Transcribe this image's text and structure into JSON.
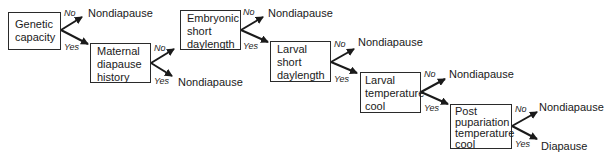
{
  "diagram": {
    "type": "decision-flow",
    "nodes": [
      {
        "id": "genetic",
        "lines": [
          "Genetic",
          "capacity"
        ]
      },
      {
        "id": "maternal",
        "lines": [
          "Maternal",
          "diapause",
          "history"
        ]
      },
      {
        "id": "embryonic",
        "lines": [
          "Embryonic",
          "short",
          "daylength"
        ]
      },
      {
        "id": "larval_day",
        "lines": [
          "Larval",
          "short",
          "daylength"
        ]
      },
      {
        "id": "larval_temp",
        "lines": [
          "Larval",
          "temperature",
          "cool"
        ]
      },
      {
        "id": "postpup",
        "lines": [
          "Post",
          "pupariation",
          "temperature",
          "cool"
        ]
      }
    ],
    "outcomes": {
      "genetic_no": "Nondiapause",
      "maternal_yes": "Nondiapause",
      "embryonic_no": "Nondiapause",
      "larval_day_no": "Nondiapause",
      "larval_temp_no": "Nondiapause",
      "postpup_no": "Nondiapause",
      "postpup_yes": "Diapause"
    },
    "branch_labels": {
      "no": "No",
      "yes": "Yes"
    },
    "edges": [
      {
        "from": "genetic",
        "label": "No",
        "to": "Nondiapause"
      },
      {
        "from": "genetic",
        "label": "Yes",
        "to": "maternal"
      },
      {
        "from": "maternal",
        "label": "No",
        "to": "embryonic"
      },
      {
        "from": "maternal",
        "label": "Yes",
        "to": "Nondiapause"
      },
      {
        "from": "embryonic",
        "label": "No",
        "to": "Nondiapause"
      },
      {
        "from": "embryonic",
        "label": "Yes",
        "to": "larval_day"
      },
      {
        "from": "larval_day",
        "label": "No",
        "to": "Nondiapause"
      },
      {
        "from": "larval_day",
        "label": "Yes",
        "to": "larval_temp"
      },
      {
        "from": "larval_temp",
        "label": "No",
        "to": "Nondiapause"
      },
      {
        "from": "larval_temp",
        "label": "Yes",
        "to": "postpup"
      },
      {
        "from": "postpup",
        "label": "No",
        "to": "Nondiapause"
      },
      {
        "from": "postpup",
        "label": "Yes",
        "to": "Diapause"
      }
    ]
  }
}
